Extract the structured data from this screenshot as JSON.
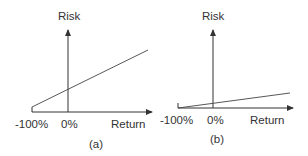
{
  "panels": [
    {
      "id": "a",
      "caption": "(a)",
      "y_axis_label": "Risk",
      "x_axis_label": "Return",
      "x_ticks": [
        "-100%",
        "0%"
      ],
      "line": {
        "from": [
          -100,
          0.1
        ],
        "slope": "steep"
      }
    },
    {
      "id": "b",
      "caption": "(b)",
      "y_axis_label": "Risk",
      "x_axis_label": "Return",
      "x_ticks": [
        "-100%",
        "0%"
      ],
      "line": {
        "from": [
          -100,
          0.0
        ],
        "slope": "shallow"
      }
    }
  ],
  "colors": {
    "ink": "#333333",
    "background": "#ffffff"
  }
}
